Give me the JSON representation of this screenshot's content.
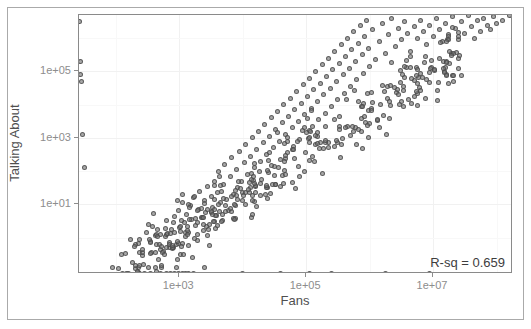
{
  "chart_data": {
    "type": "scatter",
    "title": "",
    "xlabel": "Fans",
    "ylabel": "Talking About",
    "xscale": "log",
    "yscale": "log",
    "xtick_labels": [
      "1e+03",
      "1e+05",
      "1e+07"
    ],
    "ytick_labels": [
      "1e+05",
      "1e+03",
      "1e+01"
    ],
    "xlim_log10": [
      1.42,
      8.26
    ],
    "ylim_log10": [
      -1.1,
      6.7
    ],
    "grid": true,
    "grid_color": "#f4f4f4",
    "panel_border_color": "#8a8a8a",
    "point_fill": "#737373",
    "point_stroke": "#464646",
    "point_opacity": 0.62,
    "legend": "none",
    "annotations": [
      {
        "text": "R-sq = 0.659",
        "position": "bottom-right",
        "value": 0.659
      }
    ],
    "n_points": 553,
    "points": [
      [
        1.43,
        6.52
      ],
      [
        1.44,
        5.3
      ],
      [
        1.45,
        4.9
      ],
      [
        1.46,
        4.7
      ],
      [
        1.47,
        3.1
      ],
      [
        1.5,
        2.1
      ],
      [
        1.95,
        -0.9
      ],
      [
        2.35,
        -0.9
      ],
      [
        2.62,
        -0.9
      ],
      [
        2.72,
        -0.9
      ],
      [
        2.95,
        -0.9
      ],
      [
        3.4,
        -0.9
      ],
      [
        2.1,
        -1.08
      ],
      [
        2.45,
        -1.08
      ],
      [
        2.55,
        -1.08
      ],
      [
        2.7,
        -1.08
      ],
      [
        2.8,
        -1.08
      ],
      [
        2.86,
        -1.08
      ],
      [
        2.92,
        -1.08
      ],
      [
        2.98,
        -1.08
      ],
      [
        3.05,
        -1.08
      ],
      [
        3.1,
        -1.08
      ],
      [
        3.15,
        -1.08
      ],
      [
        3.22,
        -1.08
      ],
      [
        4.0,
        -1.08
      ],
      [
        4.6,
        -1.08
      ],
      [
        5.05,
        -1.08
      ],
      [
        5.4,
        -1.08
      ],
      [
        6.25,
        -1.08
      ],
      [
        6.95,
        -1.08
      ],
      [
        2.6,
        0.72
      ],
      [
        2.62,
        0.05
      ],
      [
        2.64,
        0.1
      ],
      [
        2.7,
        -0.35
      ],
      [
        2.78,
        0.02
      ],
      [
        2.8,
        0.5
      ],
      [
        2.85,
        -0.3
      ],
      [
        2.88,
        0.25
      ],
      [
        2.92,
        0.62
      ],
      [
        2.95,
        -0.2
      ],
      [
        2.98,
        0.8
      ],
      [
        3.0,
        0.3
      ],
      [
        3.02,
        -0.5
      ],
      [
        3.05,
        1.05
      ],
      [
        3.08,
        0.45
      ],
      [
        3.1,
        0.15
      ],
      [
        3.12,
        0.7
      ],
      [
        3.15,
        -0.25
      ],
      [
        3.18,
        0.95
      ],
      [
        3.2,
        0.55
      ],
      [
        3.22,
        1.2
      ],
      [
        3.25,
        0.35
      ],
      [
        3.28,
        -0.1
      ],
      [
        3.3,
        0.85
      ],
      [
        3.32,
        1.4
      ],
      [
        3.35,
        0.6
      ],
      [
        3.38,
        0.2
      ],
      [
        3.4,
        1.1
      ],
      [
        3.42,
        0.75
      ],
      [
        3.45,
        1.55
      ],
      [
        3.48,
        0.4
      ],
      [
        3.5,
        1.25
      ],
      [
        3.52,
        0.9
      ],
      [
        3.55,
        1.7
      ],
      [
        3.58,
        0.65
      ],
      [
        3.6,
        1.35
      ],
      [
        3.62,
        2.0
      ],
      [
        3.65,
        1.05
      ],
      [
        3.68,
        0.5
      ],
      [
        3.7,
        1.6
      ],
      [
        3.72,
        2.2
      ],
      [
        3.75,
        1.15
      ],
      [
        3.78,
        0.8
      ],
      [
        3.8,
        1.85
      ],
      [
        3.82,
        2.4
      ],
      [
        3.85,
        1.3
      ],
      [
        3.88,
        0.95
      ],
      [
        3.9,
        2.05
      ],
      [
        3.92,
        1.5
      ],
      [
        3.95,
        2.6
      ],
      [
        3.98,
        1.7
      ],
      [
        4.0,
        1.1
      ],
      [
        4.02,
        2.25
      ],
      [
        4.05,
        2.8
      ],
      [
        4.08,
        1.9
      ],
      [
        4.1,
        1.35
      ],
      [
        4.12,
        2.45
      ],
      [
        4.15,
        3.0
      ],
      [
        4.18,
        2.1
      ],
      [
        4.2,
        1.55
      ],
      [
        4.22,
        2.65
      ],
      [
        4.25,
        3.2
      ],
      [
        4.28,
        2.3
      ],
      [
        4.3,
        1.75
      ],
      [
        4.32,
        2.85
      ],
      [
        4.35,
        3.4
      ],
      [
        4.38,
        2.5
      ],
      [
        4.4,
        1.95
      ],
      [
        4.42,
        3.05
      ],
      [
        4.45,
        3.6
      ],
      [
        4.48,
        2.7
      ],
      [
        4.5,
        2.15
      ],
      [
        4.52,
        3.25
      ],
      [
        4.55,
        3.8
      ],
      [
        4.58,
        2.9
      ],
      [
        4.6,
        2.35
      ],
      [
        4.62,
        3.45
      ],
      [
        4.65,
        4.0
      ],
      [
        4.68,
        3.1
      ],
      [
        4.7,
        2.55
      ],
      [
        4.72,
        3.65
      ],
      [
        4.75,
        4.2
      ],
      [
        4.78,
        3.3
      ],
      [
        4.8,
        2.75
      ],
      [
        4.82,
        3.85
      ],
      [
        4.85,
        4.4
      ],
      [
        4.88,
        3.5
      ],
      [
        4.9,
        2.95
      ],
      [
        4.92,
        4.05
      ],
      [
        4.95,
        4.6
      ],
      [
        4.98,
        3.7
      ],
      [
        5.0,
        3.15
      ],
      [
        5.02,
        4.25
      ],
      [
        5.05,
        4.8
      ],
      [
        5.08,
        3.9
      ],
      [
        5.1,
        3.35
      ],
      [
        5.12,
        4.45
      ],
      [
        5.15,
        5.0
      ],
      [
        5.18,
        4.1
      ],
      [
        5.2,
        3.55
      ],
      [
        5.22,
        4.65
      ],
      [
        5.25,
        5.2
      ],
      [
        5.28,
        4.3
      ],
      [
        5.3,
        3.75
      ],
      [
        5.32,
        4.85
      ],
      [
        5.35,
        5.4
      ],
      [
        5.38,
        4.5
      ],
      [
        5.4,
        3.95
      ],
      [
        5.42,
        5.05
      ],
      [
        5.45,
        5.6
      ],
      [
        5.48,
        4.7
      ],
      [
        5.5,
        4.15
      ],
      [
        5.52,
        5.25
      ],
      [
        5.55,
        5.8
      ],
      [
        5.58,
        4.9
      ],
      [
        5.6,
        4.35
      ],
      [
        5.62,
        5.45
      ],
      [
        5.65,
        6.0
      ],
      [
        5.68,
        5.1
      ],
      [
        5.7,
        4.55
      ],
      [
        5.72,
        5.65
      ],
      [
        5.75,
        6.2
      ],
      [
        5.78,
        5.3
      ],
      [
        5.8,
        4.75
      ],
      [
        5.82,
        5.85
      ],
      [
        5.85,
        6.4
      ],
      [
        5.88,
        5.5
      ],
      [
        5.9,
        4.95
      ],
      [
        5.92,
        6.05
      ],
      [
        5.95,
        6.55
      ],
      [
        5.98,
        5.7
      ],
      [
        6.0,
        5.15
      ],
      [
        6.05,
        6.25
      ],
      [
        6.1,
        5.35
      ],
      [
        6.15,
        5.9
      ],
      [
        6.2,
        6.45
      ],
      [
        6.25,
        5.55
      ],
      [
        6.3,
        6.1
      ],
      [
        6.35,
        6.6
      ],
      [
        6.4,
        5.75
      ],
      [
        6.45,
        6.3
      ],
      [
        6.5,
        5.95
      ],
      [
        6.55,
        6.5
      ],
      [
        6.6,
        6.15
      ],
      [
        6.65,
        5.6
      ],
      [
        6.7,
        6.35
      ],
      [
        6.75,
        6.0
      ],
      [
        6.8,
        6.55
      ],
      [
        6.85,
        6.2
      ],
      [
        6.9,
        5.8
      ],
      [
        6.95,
        6.4
      ],
      [
        7.0,
        6.05
      ],
      [
        7.05,
        6.6
      ],
      [
        7.1,
        6.25
      ],
      [
        7.15,
        5.9
      ],
      [
        7.2,
        6.45
      ],
      [
        7.25,
        6.1
      ],
      [
        7.3,
        6.65
      ],
      [
        7.35,
        6.3
      ],
      [
        7.4,
        5.95
      ],
      [
        7.45,
        6.5
      ],
      [
        7.5,
        6.15
      ],
      [
        7.55,
        6.7
      ],
      [
        7.6,
        6.35
      ],
      [
        7.65,
        6.0
      ],
      [
        7.7,
        6.55
      ],
      [
        7.75,
        6.2
      ],
      [
        7.8,
        6.6
      ],
      [
        7.85,
        6.4
      ],
      [
        7.9,
        6.25
      ],
      [
        7.95,
        6.65
      ],
      [
        8.0,
        6.45
      ],
      [
        8.1,
        6.55
      ],
      [
        8.2,
        6.72
      ]
    ]
  },
  "axes": {
    "y_title": "Talking About",
    "x_title": "Fans",
    "y_ticks": [
      {
        "label": "1e+05",
        "log10": 5
      },
      {
        "label": "1e+03",
        "log10": 3
      },
      {
        "label": "1e+01",
        "log10": 1
      }
    ],
    "x_ticks": [
      {
        "label": "1e+03",
        "log10": 3
      },
      {
        "label": "1e+05",
        "log10": 5
      },
      {
        "label": "1e+07",
        "log10": 7
      }
    ]
  },
  "annotation": {
    "rsq_label": "R-sq = 0.659"
  }
}
